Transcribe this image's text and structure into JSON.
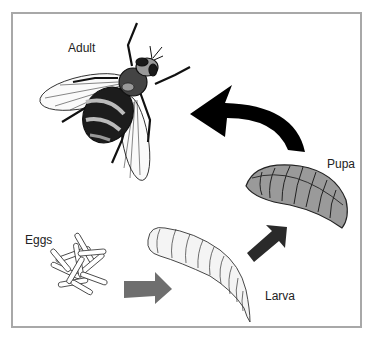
{
  "diagram": {
    "stages": [
      {
        "id": "adult",
        "label": "Adult"
      },
      {
        "id": "eggs",
        "label": "Eggs"
      },
      {
        "id": "larva",
        "label": "Larva"
      },
      {
        "id": "pupa",
        "label": "Pupa"
      }
    ],
    "arrows": [
      {
        "from": "eggs",
        "to": "larva",
        "color": "#6e6e6e"
      },
      {
        "from": "larva",
        "to": "pupa",
        "color": "#2a2a2a"
      },
      {
        "from": "pupa",
        "to": "adult",
        "color": "#000000"
      }
    ],
    "colors": {
      "border": "#a8a8a8",
      "pupa_fill": "#9a9a9a",
      "larva_fill": "#f4f4f4",
      "egg_fill": "#ffffff"
    }
  }
}
